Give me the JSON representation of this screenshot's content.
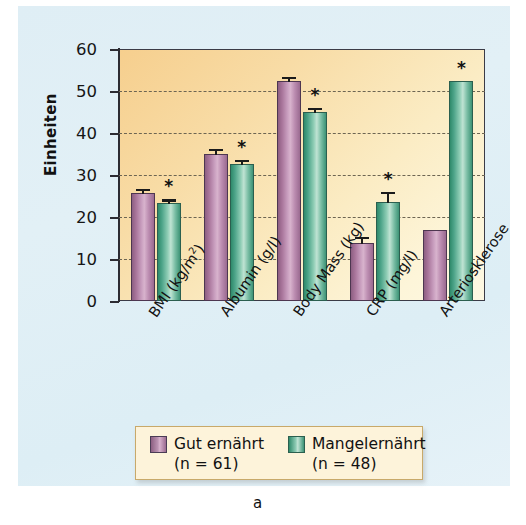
{
  "figure": {
    "caption": "a",
    "y_axis_title": "Einheiten"
  },
  "legend": {
    "entries": [
      {
        "name": "well-nourished",
        "label": "Gut ernährt",
        "n_text": "(n = 61)",
        "color": "#b88aad"
      },
      {
        "name": "malnourished",
        "label": "Mangelernährt",
        "n_text": "(n = 48)",
        "color": "#6cb79b"
      }
    ]
  },
  "chart_data": {
    "type": "bar",
    "title": "",
    "xlabel": "",
    "ylabel": "Einheiten",
    "ylim": [
      0,
      60
    ],
    "yticks": [
      0,
      10,
      20,
      30,
      40,
      50,
      60
    ],
    "ytick_labels": [
      "0",
      "10",
      "20",
      "30",
      "40",
      "50",
      "60"
    ],
    "grid": true,
    "legend_position": "below-axes",
    "categories": [
      "BMI (kg/m2)",
      "Albumin (g/l)",
      "Body Mass (kg)",
      "CRP (mg/l)",
      "Arteriosklerose"
    ],
    "category_labels_display": [
      {
        "text": "BMI (kg/m",
        "sup": "2",
        "tail": ")"
      },
      {
        "text": "Albumin (g/l)",
        "sup": "",
        "tail": ""
      },
      {
        "text": "Body Mass (kg)",
        "sup": "",
        "tail": ""
      },
      {
        "text": "CRP (mg/l)",
        "sup": "",
        "tail": ""
      },
      {
        "text": "Arteriosklerose",
        "sup": "",
        "tail": ""
      }
    ],
    "series": [
      {
        "name": "Gut ernährt",
        "color": "#b88aad",
        "values": [
          25.7,
          35.0,
          52.3,
          13.8,
          17.0
        ],
        "errors": [
          1.0,
          1.2,
          1.0,
          1.5,
          0.0
        ],
        "significance": [
          "",
          "",
          "",
          "",
          ""
        ]
      },
      {
        "name": "Mangelernährt",
        "color": "#6cb79b",
        "values": [
          23.4,
          32.7,
          45.0,
          23.5,
          52.5
        ],
        "errors": [
          0.8,
          0.9,
          1.0,
          2.5,
          0.0
        ],
        "significance": [
          "*",
          "*",
          "*",
          "*",
          "*"
        ]
      }
    ],
    "annotations": [
      {
        "text": "*",
        "series": "Mangelernährt",
        "category": "BMI (kg/m2)"
      },
      {
        "text": "*",
        "series": "Mangelernährt",
        "category": "Albumin (g/l)"
      },
      {
        "text": "*",
        "series": "Mangelernährt",
        "category": "Body Mass (kg)"
      },
      {
        "text": "*",
        "series": "Mangelernährt",
        "category": "CRP (mg/l)"
      },
      {
        "text": "*",
        "series": "Mangelernährt",
        "category": "Arteriosklerose"
      }
    ]
  }
}
